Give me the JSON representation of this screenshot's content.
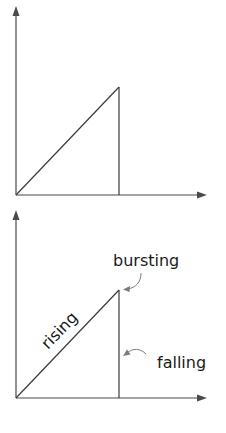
{
  "diagrams": [
    {
      "id": "top",
      "labels": {}
    },
    {
      "id": "bottom",
      "labels": {
        "rising": "rising",
        "bursting": "bursting",
        "falling": "falling"
      }
    }
  ],
  "colors": {
    "axis": "#4a4a4a",
    "line": "#3a3a3a",
    "pointer": "#7a7a7a",
    "text": "#1a1a1a",
    "background": "#ffffff"
  }
}
